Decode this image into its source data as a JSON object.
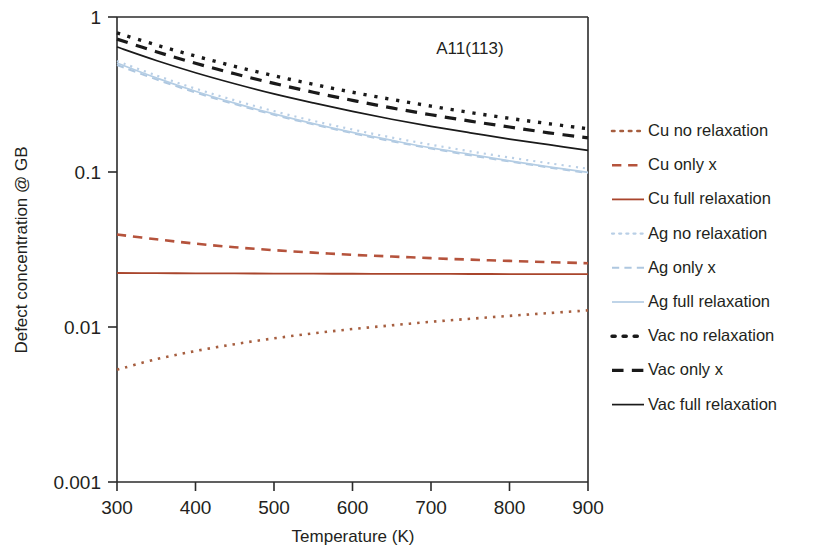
{
  "chart_data": {
    "type": "line",
    "title": "",
    "annotation": "Α11(113)",
    "xlabel": "Temperature (K)",
    "ylabel": "Defect concentration @ GB",
    "xlim": [
      300,
      900
    ],
    "ylim": [
      0.001,
      1
    ],
    "yscale": "log",
    "xticks": [
      300,
      400,
      500,
      600,
      700,
      800,
      900
    ],
    "xtick_labels": [
      "300",
      "400",
      "500",
      "600",
      "700",
      "800",
      "900"
    ],
    "yticks": [
      0.001,
      0.01,
      0.1,
      1
    ],
    "ytick_labels": [
      "0.001",
      "0.01",
      "0.1",
      "1"
    ],
    "grid": false,
    "legend_position": "right",
    "x": [
      300,
      350,
      400,
      450,
      500,
      550,
      600,
      650,
      700,
      750,
      800,
      850,
      900
    ],
    "series": [
      {
        "name": "Cu no relaxation",
        "color": "#a65e3f",
        "dash": "dotted",
        "values": [
          0.0053,
          0.0062,
          0.007,
          0.00775,
          0.00845,
          0.0091,
          0.0097,
          0.01025,
          0.0108,
          0.0113,
          0.0118,
          0.0123,
          0.0128
        ]
      },
      {
        "name": "Cu only x",
        "color": "#b5533c",
        "dash": "dashed",
        "values": [
          0.0395,
          0.0368,
          0.0345,
          0.0327,
          0.0313,
          0.0302,
          0.0292,
          0.0285,
          0.0278,
          0.0272,
          0.0267,
          0.0262,
          0.0258
        ]
      },
      {
        "name": "Cu full relaxation",
        "color": "#a9452c",
        "dash": "solid",
        "values": [
          0.0223,
          0.02225,
          0.0222,
          0.02215,
          0.02212,
          0.02208,
          0.02205,
          0.02202,
          0.022,
          0.02198,
          0.02196,
          0.02194,
          0.02192
        ]
      },
      {
        "name": "Ag no relaxation",
        "color": "#b9cfe6",
        "dash": "dotted",
        "values": [
          0.52,
          0.42,
          0.345,
          0.29,
          0.247,
          0.214,
          0.188,
          0.167,
          0.15,
          0.136,
          0.124,
          0.114,
          0.105
        ]
      },
      {
        "name": "Ag only x",
        "color": "#aec7e0",
        "dash": "dashed",
        "values": [
          0.49,
          0.396,
          0.326,
          0.274,
          0.234,
          0.203,
          0.178,
          0.158,
          0.142,
          0.128,
          0.117,
          0.107,
          0.0985
        ]
      },
      {
        "name": "Ag full relaxation",
        "color": "#b4cde4",
        "dash": "solid",
        "values": [
          0.505,
          0.405,
          0.332,
          0.278,
          0.237,
          0.205,
          0.18,
          0.16,
          0.143,
          0.13,
          0.118,
          0.108,
          0.0995
        ]
      },
      {
        "name": "Vac no relaxation",
        "color": "#1a1a1a",
        "dash": "dotted",
        "values": [
          0.79,
          0.66,
          0.56,
          0.48,
          0.418,
          0.368,
          0.327,
          0.294,
          0.266,
          0.242,
          0.222,
          0.205,
          0.19
        ]
      },
      {
        "name": "Vac only x",
        "color": "#1a1a1a",
        "dash": "dashed",
        "values": [
          0.72,
          0.597,
          0.503,
          0.43,
          0.373,
          0.327,
          0.29,
          0.259,
          0.234,
          0.213,
          0.195,
          0.179,
          0.166
        ]
      },
      {
        "name": "Vac full relaxation",
        "color": "#1a1a1a",
        "dash": "solid",
        "values": [
          0.64,
          0.524,
          0.437,
          0.371,
          0.319,
          0.279,
          0.246,
          0.219,
          0.197,
          0.179,
          0.163,
          0.15,
          0.138
        ]
      }
    ]
  },
  "legend": {
    "items": [
      {
        "label": "Cu no relaxation"
      },
      {
        "label": "Cu only x"
      },
      {
        "label": "Cu full relaxation"
      },
      {
        "label": "Ag no relaxation"
      },
      {
        "label": "Ag only x"
      },
      {
        "label": "Ag full relaxation"
      },
      {
        "label": "Vac no relaxation"
      },
      {
        "label": "Vac only x"
      },
      {
        "label": "Vac full relaxation"
      }
    ]
  }
}
